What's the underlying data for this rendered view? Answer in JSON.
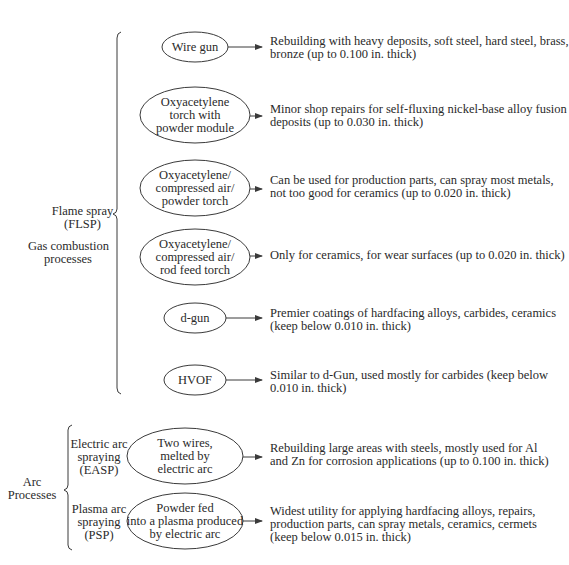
{
  "diagram": {
    "type": "thermal-spray-process-classification",
    "groups": [
      {
        "id": "gas",
        "label_lines": [
          "Flame spray",
          "(FLSP)"
        ],
        "sublabel_lines": [
          "Gas combustion",
          "processes"
        ],
        "processes": [
          {
            "id": "wire-gun",
            "name_lines": [
              "Wire gun"
            ],
            "desc_lines": [
              "Rebuilding with heavy deposits, soft steel, hard steel, brass,",
              "bronze (up to 0.100 in. thick)"
            ]
          },
          {
            "id": "oxy-powder-module",
            "name_lines": [
              "Oxyacetylene",
              "torch with",
              "powder module"
            ],
            "desc_lines": [
              "Minor shop repairs for self-fluxing nickel-base alloy fusion",
              "deposits (up to 0.030 in. thick)"
            ]
          },
          {
            "id": "oxy-air-powder",
            "name_lines": [
              "Oxyacetylene/",
              "compressed air/",
              "powder torch"
            ],
            "desc_lines": [
              "Can be used for production parts, can spray most metals,",
              "not too good for ceramics (up to 0.020 in. thick)"
            ]
          },
          {
            "id": "oxy-air-rod",
            "name_lines": [
              "Oxyacetylene/",
              "compressed air/",
              "rod feed torch"
            ],
            "desc_lines": [
              "Only for ceramics, for wear surfaces (up to 0.020 in. thick)"
            ]
          },
          {
            "id": "d-gun",
            "name_lines": [
              "d-gun"
            ],
            "desc_lines": [
              "Premier coatings of hardfacing alloys, carbides, ceramics",
              "(keep below 0.010 in. thick)"
            ]
          },
          {
            "id": "hvof",
            "name_lines": [
              "HVOF"
            ],
            "desc_lines": [
              "Similar to d-Gun, used mostly for carbides (keep below",
              "0.010 in. thick)"
            ]
          }
        ]
      },
      {
        "id": "arc",
        "label_lines": [
          "Arc",
          "Processes"
        ],
        "processes": [
          {
            "id": "easp",
            "label_lines": [
              "Electric arc",
              "spraying",
              "(EASP)"
            ],
            "name_lines": [
              "Two wires,",
              "melted by",
              "electric arc"
            ],
            "desc_lines": [
              "Rebuilding large areas with steels, mostly used for Al",
              "and Zn for corrosion applications (up to 0.100 in. thick)"
            ]
          },
          {
            "id": "psp",
            "label_lines": [
              "Plasma arc",
              "spraying",
              "(PSP)"
            ],
            "name_lines": [
              "Powder fed",
              "into a plasma produced",
              "by electric arc"
            ],
            "desc_lines": [
              "Widest utility for applying hardfacing alloys, repairs,",
              "production parts, can spray metals, ceramics, cermets",
              "(keep below 0.015 in. thick)"
            ]
          }
        ]
      }
    ]
  },
  "colors": {
    "stroke": "#3a3a3a",
    "text": "#2a2a2a",
    "background": "#ffffff"
  }
}
